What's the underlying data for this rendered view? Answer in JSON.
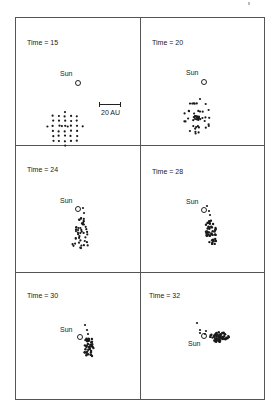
{
  "figure": {
    "panels": [
      {
        "time_label": "Time = 15",
        "sun_label": "Sun",
        "label_pos": [
          27,
          39
        ],
        "sun_label_pos": [
          60,
          70
        ],
        "sun_circle_pos": [
          75,
          80
        ],
        "cluster": {
          "cx": 65,
          "cy": 128,
          "shape": "grid",
          "rx": 19,
          "ry": 19
        }
      },
      {
        "time_label": "Time = 20",
        "sun_label": "Sun",
        "label_pos": [
          152,
          39
        ],
        "sun_label_pos": [
          186,
          69
        ],
        "sun_circle_pos": [
          201,
          79
        ],
        "cluster": {
          "cx": 197,
          "cy": 117,
          "shape": "radial",
          "rx": 14,
          "ry": 17
        }
      },
      {
        "time_label": "Time = 24",
        "sun_label": "Sun",
        "label_pos": [
          27,
          166
        ],
        "sun_label_pos": [
          60,
          197
        ],
        "sun_circle_pos": [
          75,
          206
        ],
        "cluster": {
          "cx": 80,
          "cy": 233,
          "shape": "elongated",
          "rx": 9,
          "ry": 16
        }
      },
      {
        "time_label": "Time = 28",
        "sun_label": "Sun",
        "label_pos": [
          152,
          168
        ],
        "sun_label_pos": [
          186,
          198
        ],
        "sun_circle_pos": [
          201,
          207
        ],
        "cluster": {
          "cx": 211,
          "cy": 228,
          "shape": "tight",
          "rx": 5,
          "ry": 12
        }
      },
      {
        "time_label": "Time = 30",
        "sun_label": "Sun",
        "label_pos": [
          27,
          292
        ],
        "sun_label_pos": [
          60,
          326
        ],
        "sun_circle_pos": [
          77,
          334
        ],
        "cluster": {
          "cx": 89,
          "cy": 344,
          "shape": "tight",
          "rx": 5,
          "ry": 9
        }
      },
      {
        "time_label": "Time = 32",
        "sun_label": "Sun",
        "label_pos": [
          149,
          292
        ],
        "sun_label_pos": [
          188,
          340
        ],
        "sun_circle_pos": [
          201,
          333
        ],
        "cluster": {
          "cx": 217,
          "cy": 337,
          "shape": "smear",
          "rx": 10,
          "ry": 5
        }
      }
    ],
    "scale_bar": {
      "label": "20 AU",
      "x": 99,
      "y": 104,
      "width": 22
    },
    "colors": {
      "ink": "#1a1a1a",
      "frame": "#555555",
      "background": "#ffffff"
    }
  }
}
